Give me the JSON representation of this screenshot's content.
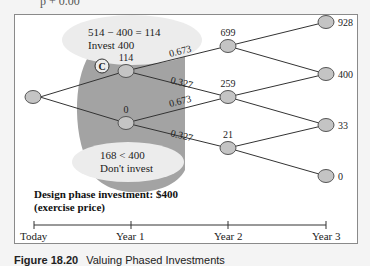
{
  "figure": {
    "top_fragment": "p + 0.00",
    "caption_label": "Figure 18.20",
    "caption_text": "Valuing Phased Investments"
  },
  "tree": {
    "root": {
      "label": ""
    },
    "year1": [
      {
        "value": "114"
      },
      {
        "value": "0"
      }
    ],
    "year2": [
      {
        "value": "699"
      },
      {
        "value": "259"
      },
      {
        "value": "21"
      }
    ],
    "year3": [
      {
        "value": "928"
      },
      {
        "value": "400"
      },
      {
        "value": "33"
      },
      {
        "value": "0"
      }
    ],
    "probabilities": {
      "up": "0.673",
      "down": "0.327"
    }
  },
  "annotations": {
    "invest_calc": "514 − 400 = 114",
    "invest_decision": "Invest 400",
    "dont_calc": "168 < 400",
    "dont_decision": "Don't invest",
    "marker": "C",
    "design_phase_line1": "Design phase investment: $400",
    "design_phase_line2": "(exercise price)"
  },
  "timeline": {
    "ticks": [
      "Today",
      "Year 1",
      "Year 2",
      "Year 3"
    ]
  },
  "colors": {
    "node_fill": "#c4c4c4",
    "node_stroke": "#555555",
    "shaded_region": "#a3a3a3",
    "callout_fill": "#ececec",
    "line": "#333333"
  }
}
